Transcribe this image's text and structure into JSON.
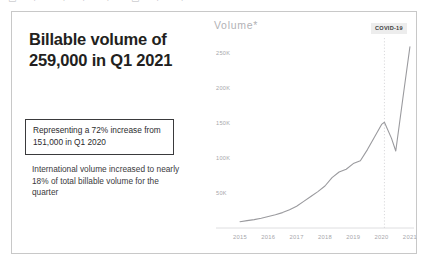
{
  "toolbar": {
    "glyph_fragments": "▭ ⌐ ¬ ⌐  ⌐ ▭ ⌐ ⌐"
  },
  "left_panel": {
    "headline": "Billable volume of 259,000 in Q1 2021",
    "callout": "Representing a 72% increase from 151,000 in Q1 2020",
    "subtext": "International volume increased to nearly 18% of total billable volume for the quarter"
  },
  "chart_panel": {
    "title": "Volume*",
    "annotation_label": "COVID-19"
  },
  "colors": {
    "headline": "#231f20",
    "callout_border": "#3a3a3c",
    "card_border": "#c8c8c8",
    "line": "#9a9a9e",
    "tick_text": "#a6a6aa",
    "annotation_bg": "#ededed"
  },
  "chart_data": {
    "type": "line",
    "title": "Volume*",
    "xlabel": "",
    "ylabel": "Volume",
    "xlim": [
      2015,
      2021.25
    ],
    "ylim": [
      0,
      270000
    ],
    "grid": false,
    "legend": false,
    "y_ticks": [
      {
        "label": "50K",
        "value": 50000
      },
      {
        "label": "100K",
        "value": 100000
      },
      {
        "label": "150K",
        "value": 150000
      },
      {
        "label": "200K",
        "value": 200000
      },
      {
        "label": "250K",
        "value": 250000
      }
    ],
    "x_ticks": [
      {
        "label": "2015",
        "value": 2015
      },
      {
        "label": "2016",
        "value": 2016
      },
      {
        "label": "2017",
        "value": 2017
      },
      {
        "label": "2018",
        "value": 2018
      },
      {
        "label": "2019",
        "value": 2019
      },
      {
        "label": "2020",
        "value": 2020
      },
      {
        "label": "2021",
        "value": 2021
      }
    ],
    "annotations": [
      {
        "label": "COVID-19",
        "x": 2020.1,
        "type": "vertical-dotted-line"
      }
    ],
    "series": [
      {
        "name": "Billable volume",
        "x": [
          2015.0,
          2015.25,
          2015.5,
          2015.75,
          2016.0,
          2016.25,
          2016.5,
          2016.75,
          2017.0,
          2017.25,
          2017.5,
          2017.75,
          2018.0,
          2018.25,
          2018.5,
          2018.75,
          2019.0,
          2019.25,
          2019.5,
          2019.75,
          2020.0,
          2020.1,
          2020.35,
          2020.5,
          2020.75,
          2021.0
        ],
        "values": [
          9000,
          10500,
          12000,
          14000,
          16500,
          19000,
          22000,
          26000,
          31000,
          38000,
          45000,
          52000,
          60000,
          72000,
          80000,
          84000,
          92000,
          96000,
          112000,
          130000,
          148000,
          151000,
          128000,
          110000,
          185000,
          259000
        ]
      }
    ]
  }
}
